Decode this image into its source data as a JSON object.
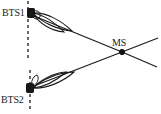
{
  "figure": {
    "type": "diagram",
    "title": "",
    "background_color": "#ffffff",
    "stroke_color": "#1a1a1a",
    "width": 161,
    "height": 114
  },
  "nodes": [
    {
      "id": "bts1",
      "label": "BTS1",
      "label_x": 2,
      "label_y": 16,
      "marker_x": 31,
      "marker_y": 13,
      "marker_w": 7,
      "marker_h": 9,
      "marker_name": "bts1-station-marker",
      "icon": "base-station-icon"
    },
    {
      "id": "bts2",
      "label": "BTS2",
      "label_x": 1,
      "label_y": 103,
      "marker_x": 30,
      "marker_y": 88,
      "marker_w": 7,
      "marker_h": 9,
      "marker_name": "bts2-station-marker",
      "icon": "base-station-icon"
    },
    {
      "id": "ms",
      "label": "MS",
      "label_x": 112,
      "label_y": 46,
      "marker_x": 122,
      "marker_y": 52,
      "marker_r": 2.6,
      "marker_name": "ms-mobile-marker",
      "icon": "mobile-station-icon"
    }
  ],
  "reference_lines": [
    {
      "name": "bts1-vertical-reference",
      "x1": 28,
      "y1": 1,
      "x2": 28,
      "y2": 58,
      "style": "dashed",
      "dash": "3,3",
      "width": 1.3
    },
    {
      "name": "bts2-vertical-reference",
      "x1": 30,
      "y1": 70,
      "x2": 30,
      "y2": 112,
      "style": "dashed",
      "dash": "3,3",
      "width": 1.3
    }
  ],
  "beam_paths": [
    {
      "name": "bts1-to-ms-path",
      "from": "bts1",
      "to": "ms",
      "x1": 34,
      "y1": 16,
      "x2": 122,
      "y2": 52,
      "width": 1.2
    },
    {
      "name": "bts1-path-extension",
      "from": "ms",
      "to": "edge",
      "x1": 122,
      "y1": 52,
      "x2": 157,
      "y2": 67,
      "width": 1.2
    },
    {
      "name": "bts2-to-ms-path",
      "from": "bts2",
      "to": "ms",
      "x1": 34,
      "y1": 86,
      "x2": 122,
      "y2": 52,
      "width": 1.2
    },
    {
      "name": "bts2-path-extension",
      "from": "ms",
      "to": "edge",
      "x1": 122,
      "y1": 52,
      "x2": 158,
      "y2": 38,
      "width": 1.2
    }
  ],
  "antenna_lobes": [
    {
      "name": "bts1-antenna-lobe-outer",
      "owner": "bts1",
      "d": "M 33 13 C 46 12 62 21 72 31 C 59 30 42 23 33 13 Z",
      "width": 1.1
    },
    {
      "name": "bts1-antenna-lobe-inner",
      "owner": "bts1",
      "d": "M 33 13 C 44 15 56 23 64 32 C 52 31 39 24 33 13 Z",
      "width": 1.1
    },
    {
      "name": "bts1-antenna-lobe-small",
      "owner": "bts1",
      "d": "M 32 12 C 37 9 41 12 40 17 C 37 21 32 19 32 12 Z",
      "width": 1.0
    },
    {
      "name": "bts2-antenna-lobe-outer",
      "owner": "bts2",
      "d": "M 33 88 C 46 89 63 82 74 72 C 60 72 42 79 33 88 Z",
      "width": 1.1
    },
    {
      "name": "bts2-antenna-lobe-inner",
      "owner": "bts2",
      "d": "M 33 88 C 45 87 57 80 66 72 C 53 73 40 80 33 88 Z",
      "width": 1.1
    },
    {
      "name": "bts2-antenna-lobe-small",
      "owner": "bts2",
      "d": "M 32 87 C 37 84 40 79 37 75 C 32 77 31 82 32 87 Z",
      "width": 1.0
    }
  ]
}
